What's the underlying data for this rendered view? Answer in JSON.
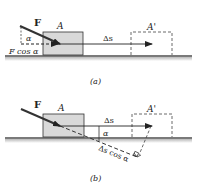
{
  "figure_a": {
    "force_label": "F",
    "block_label": "A",
    "block_prime_label": "A'",
    "alpha_label": "α",
    "fcos_label": "F cos α",
    "displacement_label": "Δs",
    "caption": "(a)"
  },
  "figure_b": {
    "force_label": "F",
    "block_label": "A",
    "block_prime_label": "A'",
    "alpha_label": "α",
    "displacement_label": "Δs",
    "scos_label": "Δs cos α",
    "caption": "(b)"
  },
  "colors": {
    "block_fill": "#d9d9d9",
    "ground": "#7a7a7a",
    "ink": "#222222"
  }
}
